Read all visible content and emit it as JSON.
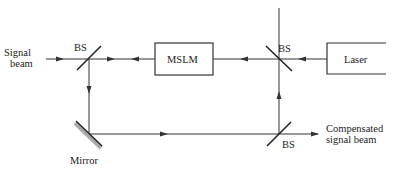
{
  "diagram": {
    "type": "optical-setup",
    "colors": {
      "line": "#333333",
      "mirror_shade": "#999999",
      "text": "#222222"
    },
    "labels": {
      "signal_beam_line1": "Signal",
      "signal_beam_line2": "beam",
      "bs_left": "BS",
      "bs_top_right": "BS",
      "bs_bottom_right": "BS",
      "mslm": "MSLM",
      "laser": "Laser",
      "mirror": "Mirror",
      "output_line1": "Compensated",
      "output_line2": "signal beam"
    },
    "components": [
      {
        "id": "bs-left",
        "kind": "beam-splitter",
        "label": "BS"
      },
      {
        "id": "mslm",
        "kind": "box",
        "label": "MSLM"
      },
      {
        "id": "bs-top-right",
        "kind": "beam-splitter",
        "label": "BS"
      },
      {
        "id": "laser",
        "kind": "box",
        "label": "Laser"
      },
      {
        "id": "mirror",
        "kind": "mirror",
        "label": "Mirror"
      },
      {
        "id": "bs-bottom-right",
        "kind": "beam-splitter",
        "label": "BS"
      }
    ],
    "connections": [
      {
        "from": "signal-input",
        "to": "bs-left"
      },
      {
        "from": "mslm",
        "to": "bs-left"
      },
      {
        "from": "bs-top-right",
        "to": "mslm"
      },
      {
        "from": "laser",
        "to": "bs-top-right"
      },
      {
        "from": "bs-left",
        "to": "mirror"
      },
      {
        "from": "mirror",
        "to": "bs-bottom-right"
      },
      {
        "from": "bs-bottom-right",
        "to": "bs-top-right"
      },
      {
        "from": "bs-bottom-right",
        "to": "compensated-output"
      }
    ]
  }
}
